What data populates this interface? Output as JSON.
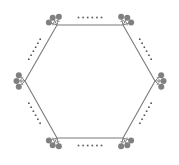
{
  "diagram": {
    "type": "hexagon-with-trees",
    "colors": {
      "background": "#ffffff",
      "edge": "#7a7a7a",
      "tree": "#808080",
      "dots": "#555555"
    },
    "vertices": [
      {
        "id": "top-left",
        "x": 57,
        "y": 25
      },
      {
        "id": "top-right",
        "x": 123,
        "y": 25
      },
      {
        "id": "right",
        "x": 155,
        "y": 81
      },
      {
        "id": "bottom-right",
        "x": 123,
        "y": 138
      },
      {
        "id": "bottom-left",
        "x": 57,
        "y": 138
      },
      {
        "id": "left",
        "x": 25,
        "y": 81
      }
    ],
    "trees_per_vertex": 3,
    "dots_per_side": 6
  }
}
